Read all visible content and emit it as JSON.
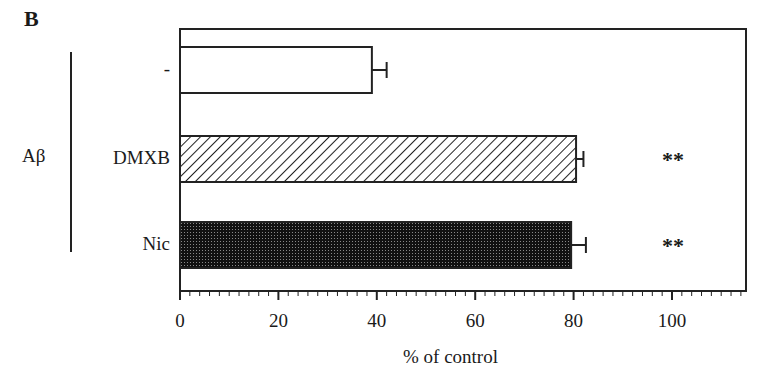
{
  "panel_label": "B",
  "group_label": "Aβ",
  "chart_data": {
    "type": "bar",
    "orientation": "horizontal",
    "title": "",
    "xlabel": "% of control",
    "ylabel": "Aβ",
    "categories": [
      "-",
      "DMXB",
      "Nic"
    ],
    "values": [
      39,
      80.5,
      79.5
    ],
    "errors": [
      3,
      1.5,
      3
    ],
    "significance": [
      "",
      "**",
      "**"
    ],
    "fills": [
      "white",
      "diagonal-hatch",
      "dense-crosshatch"
    ],
    "xlim": [
      0,
      115
    ],
    "xticks": [
      0,
      20,
      40,
      60,
      80,
      100
    ],
    "xtick_labels": [
      "0",
      "20",
      "40",
      "60",
      "80",
      "100"
    ],
    "minor_tick_step": 2,
    "grid": false,
    "legend": null
  }
}
